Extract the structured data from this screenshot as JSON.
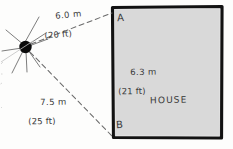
{
  "diagram": {
    "background_color": "#fdfdfc",
    "ink_color": "#3a3a3a",
    "house": {
      "label": "HOUSE",
      "fill_color": "#d8d8d8",
      "border_color": "#111111",
      "corner_a_label": "A",
      "corner_b_label": "B"
    },
    "measurements": {
      "top": {
        "metric": "6.0 m",
        "imperial": "(20 ft)"
      },
      "bottom": {
        "metric": "7.5 m",
        "imperial": "(25 ft)"
      },
      "side": {
        "metric": "6.3 m",
        "imperial": "(21 ft)"
      }
    },
    "marker": {
      "name": "tree-point-marker",
      "color": "#000000"
    }
  }
}
